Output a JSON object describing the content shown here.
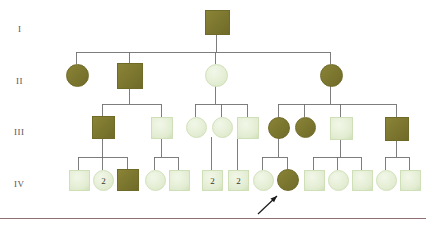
{
  "figure": {
    "type": "pedigree-chart",
    "generation_labels": [
      {
        "text": "I",
        "x": 18,
        "y": 24
      },
      {
        "text": "II",
        "x": 16,
        "y": 76
      },
      {
        "text": "III",
        "x": 14,
        "y": 127
      },
      {
        "text": "IV",
        "x": 14,
        "y": 179
      }
    ],
    "colors": {
      "affected_fill": "#8a8437",
      "affected_fill_dark": "#6f6a28",
      "unaffected_fill": "#e2ecd1",
      "unaffected_fill_edge": "#cfe0b8",
      "symbol_stroke": "#b9c9a3",
      "line": "#6f6f6f",
      "label": "#59524f",
      "rule": "#8d6f74",
      "arrow": "#1a1a1a",
      "number_text": "#3a3a32"
    },
    "bottom_rule": {
      "y": 218,
      "width": 426,
      "color": "#8d6f74"
    },
    "proband_arrow": {
      "from_x": 258,
      "from_y": 214,
      "to_x": 277,
      "to_y": 196,
      "label": "proband-arrow"
    },
    "individuals": [
      {
        "id": "I-1",
        "shape": "square",
        "status": "affected",
        "x": 205,
        "y": 10,
        "size": 23,
        "number": ""
      },
      {
        "id": "II-1",
        "shape": "circle",
        "status": "affected",
        "x": 66,
        "y": 64,
        "size": 21,
        "number": ""
      },
      {
        "id": "II-2",
        "shape": "square",
        "status": "affected",
        "x": 117,
        "y": 63,
        "size": 24,
        "number": ""
      },
      {
        "id": "II-3",
        "shape": "circle",
        "status": "unaffected",
        "x": 205,
        "y": 64,
        "size": 21,
        "number": ""
      },
      {
        "id": "II-4",
        "shape": "circle",
        "status": "affected",
        "x": 320,
        "y": 64,
        "size": 21,
        "number": ""
      },
      {
        "id": "III-1",
        "shape": "square",
        "status": "affected",
        "x": 92,
        "y": 116,
        "size": 21,
        "number": ""
      },
      {
        "id": "III-2",
        "shape": "square",
        "status": "unaffected",
        "x": 151,
        "y": 117,
        "size": 20,
        "number": ""
      },
      {
        "id": "III-3",
        "shape": "circle",
        "status": "unaffected",
        "x": 186,
        "y": 117,
        "size": 19,
        "number": ""
      },
      {
        "id": "III-4",
        "shape": "circle",
        "status": "unaffected",
        "x": 212,
        "y": 117,
        "size": 19,
        "number": ""
      },
      {
        "id": "III-5",
        "shape": "square",
        "status": "unaffected",
        "x": 237,
        "y": 117,
        "size": 20,
        "number": ""
      },
      {
        "id": "III-6",
        "shape": "circle",
        "status": "affected",
        "x": 268,
        "y": 117,
        "size": 20,
        "number": ""
      },
      {
        "id": "III-7",
        "shape": "circle",
        "status": "affected",
        "x": 295,
        "y": 117,
        "size": 19,
        "number": ""
      },
      {
        "id": "III-8",
        "shape": "square",
        "status": "unaffected",
        "x": 330,
        "y": 117,
        "size": 21,
        "number": ""
      },
      {
        "id": "III-9",
        "shape": "square",
        "status": "affected",
        "x": 385,
        "y": 117,
        "size": 22,
        "number": ""
      },
      {
        "id": "IV-1",
        "shape": "square",
        "status": "unaffected",
        "x": 69,
        "y": 170,
        "size": 19,
        "number": ""
      },
      {
        "id": "IV-2",
        "shape": "circle",
        "status": "unaffected",
        "x": 93,
        "y": 170,
        "size": 19,
        "number": "2"
      },
      {
        "id": "IV-3",
        "shape": "square",
        "status": "affected",
        "x": 117,
        "y": 169,
        "size": 20,
        "number": ""
      },
      {
        "id": "IV-4",
        "shape": "circle",
        "status": "unaffected",
        "x": 145,
        "y": 170,
        "size": 19,
        "number": ""
      },
      {
        "id": "IV-5",
        "shape": "square",
        "status": "unaffected",
        "x": 169,
        "y": 170,
        "size": 19,
        "number": ""
      },
      {
        "id": "IV-6",
        "shape": "square",
        "status": "unaffected",
        "x": 202,
        "y": 170,
        "size": 19,
        "number": "2"
      },
      {
        "id": "IV-7",
        "shape": "square",
        "status": "unaffected",
        "x": 228,
        "y": 170,
        "size": 19,
        "number": "2"
      },
      {
        "id": "IV-8",
        "shape": "circle",
        "status": "unaffected",
        "x": 253,
        "y": 170,
        "size": 19,
        "number": ""
      },
      {
        "id": "IV-9",
        "shape": "circle",
        "status": "affected",
        "x": 277,
        "y": 169,
        "size": 20,
        "number": ""
      },
      {
        "id": "IV-10",
        "shape": "square",
        "status": "unaffected",
        "x": 304,
        "y": 170,
        "size": 19,
        "number": ""
      },
      {
        "id": "IV-11",
        "shape": "circle",
        "status": "unaffected",
        "x": 328,
        "y": 170,
        "size": 19,
        "number": ""
      },
      {
        "id": "IV-12",
        "shape": "square",
        "status": "unaffected",
        "x": 352,
        "y": 170,
        "size": 19,
        "number": ""
      },
      {
        "id": "IV-13",
        "shape": "circle",
        "status": "unaffected",
        "x": 376,
        "y": 170,
        "size": 19,
        "number": ""
      },
      {
        "id": "IV-14",
        "shape": "square",
        "status": "unaffected",
        "x": 400,
        "y": 170,
        "size": 19,
        "number": ""
      }
    ],
    "connectors": [
      {
        "kind": "vertical",
        "x": 216,
        "y1": 33,
        "y2": 52
      },
      {
        "kind": "horizontal",
        "y": 52,
        "x1": 76,
        "x2": 330
      },
      {
        "kind": "vertical",
        "x": 76,
        "y1": 52,
        "y2": 64
      },
      {
        "kind": "vertical",
        "x": 129,
        "y1": 52,
        "y2": 63
      },
      {
        "kind": "vertical",
        "x": 215,
        "y1": 52,
        "y2": 64
      },
      {
        "kind": "vertical",
        "x": 330,
        "y1": 52,
        "y2": 64
      },
      {
        "kind": "vertical",
        "x": 129,
        "y1": 87,
        "y2": 104
      },
      {
        "kind": "horizontal",
        "y": 104,
        "x1": 102,
        "x2": 161
      },
      {
        "kind": "vertical",
        "x": 102,
        "y1": 104,
        "y2": 116
      },
      {
        "kind": "vertical",
        "x": 161,
        "y1": 104,
        "y2": 117
      },
      {
        "kind": "vertical",
        "x": 215,
        "y1": 85,
        "y2": 104
      },
      {
        "kind": "horizontal",
        "y": 104,
        "x1": 195,
        "x2": 247
      },
      {
        "kind": "vertical",
        "x": 195,
        "y1": 104,
        "y2": 117
      },
      {
        "kind": "vertical",
        "x": 221,
        "y1": 104,
        "y2": 117
      },
      {
        "kind": "vertical",
        "x": 247,
        "y1": 104,
        "y2": 117
      },
      {
        "kind": "vertical",
        "x": 330,
        "y1": 85,
        "y2": 104
      },
      {
        "kind": "horizontal",
        "y": 104,
        "x1": 278,
        "x2": 396
      },
      {
        "kind": "vertical",
        "x": 278,
        "y1": 104,
        "y2": 117
      },
      {
        "kind": "vertical",
        "x": 304,
        "y1": 104,
        "y2": 117
      },
      {
        "kind": "vertical",
        "x": 340,
        "y1": 104,
        "y2": 117
      },
      {
        "kind": "vertical",
        "x": 396,
        "y1": 104,
        "y2": 117
      },
      {
        "kind": "vertical",
        "x": 102,
        "y1": 137,
        "y2": 157
      },
      {
        "kind": "horizontal",
        "y": 157,
        "x1": 78,
        "x2": 127
      },
      {
        "kind": "vertical",
        "x": 78,
        "y1": 157,
        "y2": 170
      },
      {
        "kind": "vertical",
        "x": 102,
        "y1": 157,
        "y2": 170
      },
      {
        "kind": "vertical",
        "x": 127,
        "y1": 157,
        "y2": 169
      },
      {
        "kind": "vertical",
        "x": 161,
        "y1": 137,
        "y2": 157
      },
      {
        "kind": "horizontal",
        "y": 157,
        "x1": 154,
        "x2": 178
      },
      {
        "kind": "vertical",
        "x": 154,
        "y1": 157,
        "y2": 170
      },
      {
        "kind": "vertical",
        "x": 178,
        "y1": 157,
        "y2": 170
      },
      {
        "kind": "vertical",
        "x": 211,
        "y1": 137,
        "y2": 157
      },
      {
        "kind": "vertical",
        "x": 211,
        "y1": 157,
        "y2": 170
      },
      {
        "kind": "vertical",
        "x": 237,
        "y1": 137,
        "y2": 170
      },
      {
        "kind": "vertical",
        "x": 278,
        "y1": 137,
        "y2": 157
      },
      {
        "kind": "horizontal",
        "y": 157,
        "x1": 262,
        "x2": 287
      },
      {
        "kind": "vertical",
        "x": 262,
        "y1": 157,
        "y2": 170
      },
      {
        "kind": "vertical",
        "x": 287,
        "y1": 157,
        "y2": 169
      },
      {
        "kind": "vertical",
        "x": 340,
        "y1": 138,
        "y2": 157
      },
      {
        "kind": "horizontal",
        "y": 157,
        "x1": 313,
        "x2": 361
      },
      {
        "kind": "vertical",
        "x": 313,
        "y1": 157,
        "y2": 170
      },
      {
        "kind": "vertical",
        "x": 337,
        "y1": 157,
        "y2": 170
      },
      {
        "kind": "vertical",
        "x": 361,
        "y1": 157,
        "y2": 170
      },
      {
        "kind": "vertical",
        "x": 396,
        "y1": 139,
        "y2": 157
      },
      {
        "kind": "horizontal",
        "y": 157,
        "x1": 385,
        "x2": 409
      },
      {
        "kind": "vertical",
        "x": 385,
        "y1": 157,
        "y2": 170
      },
      {
        "kind": "vertical",
        "x": 409,
        "y1": 157,
        "y2": 170
      }
    ]
  }
}
